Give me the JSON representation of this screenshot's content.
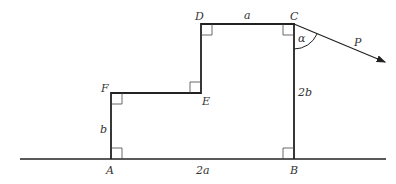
{
  "diagram": {
    "type": "geometry-figure",
    "points": {
      "A": {
        "label": "A",
        "x": 111,
        "y": 159
      },
      "B": {
        "label": "B",
        "x": 294,
        "y": 159
      },
      "C": {
        "label": "C",
        "x": 294,
        "y": 24
      },
      "D": {
        "label": "D",
        "x": 201,
        "y": 24
      },
      "E": {
        "label": "E",
        "x": 201,
        "y": 93
      },
      "F": {
        "label": "F",
        "x": 111,
        "y": 93
      }
    },
    "segment_labels": {
      "DC": "a",
      "CB": "2b",
      "FA": "b",
      "AB": "2a"
    },
    "force": {
      "label": "P",
      "angle_label": "α"
    },
    "colors": {
      "line": "#222222",
      "text": "#333333"
    }
  }
}
